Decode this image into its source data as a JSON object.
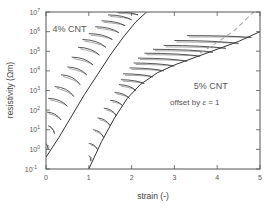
{
  "chart_data": {
    "type": "line",
    "title": "",
    "xlabel": "strain (-)",
    "ylabel": "resistivity (Ωm)",
    "xlim": [
      0,
      5
    ],
    "ylim_log10": [
      -1,
      7
    ],
    "yscale": "log",
    "grid": false,
    "x_ticks": [
      "0",
      "1",
      "2",
      "3",
      "4",
      "5"
    ],
    "y_ticks": [
      {
        "base": "10",
        "exp": "7"
      },
      {
        "base": "10",
        "exp": "6"
      },
      {
        "base": "10",
        "exp": "5"
      },
      {
        "base": "10",
        "exp": "4"
      },
      {
        "base": "10",
        "exp": "3"
      },
      {
        "base": "10",
        "exp": "2"
      },
      {
        "base": "10",
        "exp": "1"
      },
      {
        "base": "10",
        "exp": "0"
      },
      {
        "base": "10",
        "exp": "-1"
      }
    ],
    "annotations": [
      {
        "text": "4% CNT",
        "x": 0.15,
        "y_log10": 6.0
      },
      {
        "text": "5% CNT",
        "x": 3.45,
        "y_log10": 3.1
      },
      {
        "text_prefix": "offset by ",
        "symbol": "ε",
        "text_suffix": " = 1",
        "x": 2.9,
        "y_log10": 2.25
      }
    ],
    "series": [
      {
        "name": "4% CNT envelope",
        "style": "solid",
        "color": "#333333",
        "points": [
          [
            0.0,
            -0.4
          ],
          [
            0.3,
            0.6
          ],
          [
            0.6,
            1.7
          ],
          [
            0.9,
            2.8
          ],
          [
            1.2,
            3.8
          ],
          [
            1.5,
            4.8
          ],
          [
            1.8,
            5.7
          ],
          [
            2.1,
            6.5
          ],
          [
            2.35,
            7.0
          ]
        ]
      },
      {
        "name": "4% CNT cycles",
        "style": "hairpin",
        "color": "#444444",
        "cycles": [
          {
            "start": [
              0.05,
              0.0
            ],
            "end_x": 0.0,
            "end_y": 0.3
          },
          {
            "start": [
              0.2,
              0.8
            ],
            "end_x": 0.05,
            "end_y": 1.2
          },
          {
            "start": [
              0.35,
              1.5
            ],
            "end_x": 0.02,
            "end_y": 1.9
          },
          {
            "start": [
              0.5,
              2.2
            ],
            "end_x": 0.05,
            "end_y": 2.6
          },
          {
            "start": [
              0.65,
              2.7
            ],
            "end_x": 0.2,
            "end_y": 3.2
          },
          {
            "start": [
              0.8,
              3.3
            ],
            "end_x": 0.35,
            "end_y": 3.8
          },
          {
            "start": [
              0.95,
              3.8
            ],
            "end_x": 0.5,
            "end_y": 4.2
          },
          {
            "start": [
              1.1,
              4.3
            ],
            "end_x": 0.6,
            "end_y": 4.7
          },
          {
            "start": [
              1.25,
              4.8
            ],
            "end_x": 0.75,
            "end_y": 5.2
          },
          {
            "start": [
              1.4,
              5.2
            ],
            "end_x": 0.85,
            "end_y": 5.6
          },
          {
            "start": [
              1.55,
              5.6
            ],
            "end_x": 1.0,
            "end_y": 5.9
          },
          {
            "start": [
              1.7,
              5.95
            ],
            "end_x": 1.15,
            "end_y": 6.25
          },
          {
            "start": [
              1.85,
              6.3
            ],
            "end_x": 1.3,
            "end_y": 6.55
          },
          {
            "start": [
              2.0,
              6.6
            ],
            "end_x": 1.45,
            "end_y": 6.85
          },
          {
            "start": [
              2.15,
              6.85
            ],
            "end_x": 1.65,
            "end_y": 7.0
          }
        ]
      },
      {
        "name": "5% CNT envelope (offset by ε = 1)",
        "style": "solid",
        "color": "#333333",
        "points": [
          [
            1.0,
            -1.0
          ],
          [
            1.3,
            0.4
          ],
          [
            1.6,
            1.6
          ],
          [
            1.9,
            2.6
          ],
          [
            2.2,
            3.3
          ],
          [
            2.6,
            3.9
          ],
          [
            3.0,
            4.3
          ],
          [
            3.5,
            4.7
          ],
          [
            4.0,
            5.1
          ],
          [
            4.5,
            5.5
          ],
          [
            5.0,
            6.0
          ]
        ]
      },
      {
        "name": "5% CNT cycles",
        "style": "hairpin",
        "color": "#444444",
        "cycles": [
          {
            "start": [
              1.05,
              -0.6
            ],
            "end_x": 1.0,
            "end_y": -0.3
          },
          {
            "start": [
              1.2,
              0.0
            ],
            "end_x": 1.0,
            "end_y": 0.3
          },
          {
            "start": [
              1.35,
              0.6
            ],
            "end_x": 1.1,
            "end_y": 1.0
          },
          {
            "start": [
              1.5,
              1.2
            ],
            "end_x": 1.2,
            "end_y": 1.6
          },
          {
            "start": [
              1.65,
              1.7
            ],
            "end_x": 1.35,
            "end_y": 2.1
          },
          {
            "start": [
              1.8,
              2.2
            ],
            "end_x": 1.5,
            "end_y": 2.5
          },
          {
            "start": [
              1.95,
              2.6
            ],
            "end_x": 1.6,
            "end_y": 2.9
          },
          {
            "start": [
              2.1,
              3.0
            ],
            "end_x": 1.7,
            "end_y": 3.3
          },
          {
            "start": [
              2.3,
              3.35
            ],
            "end_x": 1.75,
            "end_y": 3.55
          },
          {
            "start": [
              2.5,
              3.7
            ],
            "end_x": 1.8,
            "end_y": 3.85
          },
          {
            "start": [
              2.75,
              4.0
            ],
            "end_x": 1.95,
            "end_y": 4.15
          },
          {
            "start": [
              3.0,
              4.25
            ],
            "end_x": 2.05,
            "end_y": 4.4
          },
          {
            "start": [
              3.3,
              4.5
            ],
            "end_x": 2.15,
            "end_y": 4.65
          },
          {
            "start": [
              3.6,
              4.75
            ],
            "end_x": 2.3,
            "end_y": 4.9
          },
          {
            "start": [
              3.9,
              4.95
            ],
            "end_x": 2.5,
            "end_y": 5.1
          },
          {
            "start": [
              4.2,
              5.15
            ],
            "end_x": 2.75,
            "end_y": 5.3
          },
          {
            "start": [
              4.5,
              5.4
            ],
            "end_x": 3.0,
            "end_y": 5.55
          },
          {
            "start": [
              4.8,
              5.7
            ],
            "end_x": 3.3,
            "end_y": 5.8
          }
        ]
      },
      {
        "name": "5% CNT extrapolation",
        "style": "dashed",
        "color": "#aaaaaa",
        "points": [
          [
            3.6,
            4.9
          ],
          [
            4.0,
            5.45
          ],
          [
            4.4,
            6.05
          ],
          [
            4.85,
            7.0
          ]
        ]
      }
    ]
  }
}
